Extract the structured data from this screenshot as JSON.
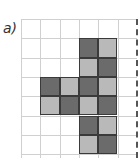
{
  "label": "a)",
  "grid": {
    "cols": 6,
    "rows": 7,
    "cell_size": 19.3,
    "line_color": "#d0d0d0",
    "dashed_edge": "right"
  },
  "colors": {
    "dark": "#6b6b6b",
    "light": "#b9b9b9"
  },
  "cells": [
    {
      "col": 3,
      "row": 1,
      "shade": "dark"
    },
    {
      "col": 4,
      "row": 1,
      "shade": "light"
    },
    {
      "col": 3,
      "row": 2,
      "shade": "light"
    },
    {
      "col": 4,
      "row": 2,
      "shade": "dark"
    },
    {
      "col": 1,
      "row": 3,
      "shade": "dark"
    },
    {
      "col": 2,
      "row": 3,
      "shade": "light"
    },
    {
      "col": 3,
      "row": 3,
      "shade": "dark"
    },
    {
      "col": 4,
      "row": 3,
      "shade": "light"
    },
    {
      "col": 1,
      "row": 4,
      "shade": "light"
    },
    {
      "col": 2,
      "row": 4,
      "shade": "dark"
    },
    {
      "col": 3,
      "row": 4,
      "shade": "light"
    },
    {
      "col": 4,
      "row": 4,
      "shade": "dark"
    },
    {
      "col": 3,
      "row": 5,
      "shade": "dark"
    },
    {
      "col": 4,
      "row": 5,
      "shade": "light"
    },
    {
      "col": 3,
      "row": 6,
      "shade": "light"
    },
    {
      "col": 4,
      "row": 6,
      "shade": "dark"
    }
  ]
}
